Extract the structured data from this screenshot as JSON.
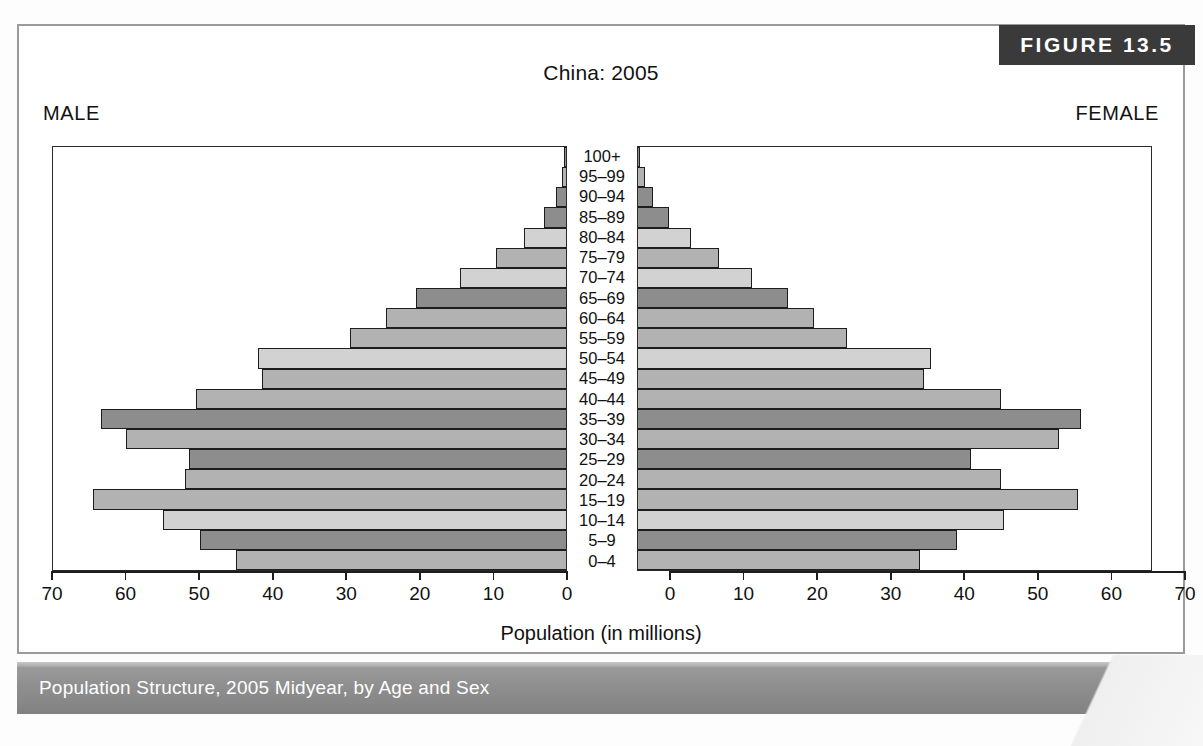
{
  "figure": {
    "title": "China: 2005",
    "male_label": "MALE",
    "female_label": "FEMALE",
    "xlabel": "Population (in millions)",
    "caption": "Population Structure, 2005 Midyear, by Age and Sex",
    "figure_number": "FIGURE 13.5",
    "colors": {
      "bar_light": "#d2d2d2",
      "bar_medium": "#b2b2b2",
      "bar_dark": "#8d8d8d",
      "bar_outline": "#1d1d1d",
      "caption_bar": "#8f8f8f",
      "badge": "#3a3a3a",
      "frame": "#9a9a9a"
    }
  },
  "chart_data": {
    "type": "bar",
    "subtype": "population-pyramid",
    "title": "China: 2005",
    "xlabel": "Population (in millions)",
    "ylabel": "",
    "xlim": [
      0,
      70
    ],
    "xticks": [
      0,
      10,
      20,
      30,
      40,
      50,
      60,
      70
    ],
    "left_axis_ticks": [
      70,
      60,
      50,
      40,
      30,
      20,
      10,
      0
    ],
    "right_axis_ticks": [
      0,
      10,
      20,
      30,
      40,
      50,
      60,
      70
    ],
    "grid": false,
    "legend": [
      "MALE",
      "FEMALE"
    ],
    "legend_position": "top-corners",
    "categories": [
      "100+",
      "95–99",
      "90–94",
      "85–89",
      "80–84",
      "75–79",
      "70–74",
      "65–69",
      "60–64",
      "55–59",
      "50–54",
      "45–49",
      "40–44",
      "35–39",
      "30–34",
      "25–29",
      "20–24",
      "15–19",
      "10–14",
      "5–9",
      "0–4"
    ],
    "series": [
      {
        "name": "MALE",
        "side": "left",
        "values": [
          0.1,
          0.5,
          1.3,
          3.0,
          5.8,
          9.5,
          14.5,
          20.5,
          24.5,
          29.5,
          42.0,
          41.5,
          50.5,
          63.5,
          60.0,
          51.5,
          52.0,
          64.5,
          55.0,
          50.0,
          45.0
        ]
      },
      {
        "name": "FEMALE",
        "side": "right",
        "values": [
          0.2,
          0.9,
          2.1,
          4.2,
          7.3,
          11.0,
          15.5,
          20.5,
          24.0,
          28.5,
          40.0,
          39.0,
          49.5,
          60.5,
          57.5,
          45.5,
          49.5,
          60.0,
          50.0,
          43.5,
          38.5
        ]
      }
    ],
    "bar_shades": [
      "dark",
      "medium",
      "dark",
      "dark",
      "light",
      "medium",
      "light",
      "dark",
      "medium",
      "medium",
      "light",
      "medium",
      "medium",
      "dark",
      "medium",
      "dark",
      "medium",
      "medium",
      "light",
      "dark",
      "medium"
    ]
  }
}
